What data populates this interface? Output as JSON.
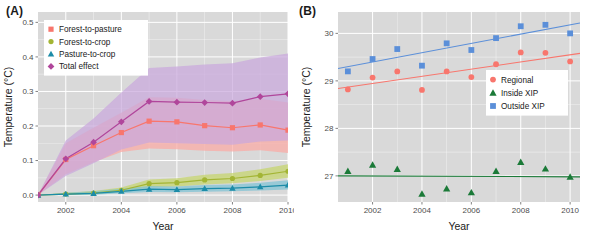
{
  "figure": {
    "panels": [
      {
        "label": "(A)"
      },
      {
        "label": "(B)"
      }
    ]
  },
  "chart_data": [
    {
      "type": "line",
      "panel": "(A)",
      "title": "",
      "xlabel": "Year",
      "ylabel": "Temperature (°C)",
      "xlim": [
        2001,
        2010
      ],
      "ylim": [
        -0.02,
        0.53
      ],
      "xticks": [
        2002,
        2004,
        2006,
        2008,
        2010
      ],
      "yticks": [
        0.0,
        0.1,
        0.2,
        0.3,
        0.4,
        0.5
      ],
      "ytick_labels": [
        "0.0",
        "0.1",
        "0.2",
        "0.3",
        "0.4",
        "0.5"
      ],
      "grid": true,
      "legend_position": "top-left",
      "x": [
        2001,
        2002,
        2003,
        2004,
        2005,
        2006,
        2007,
        2008,
        2009,
        2010
      ],
      "series": [
        {
          "name": "Forest-to-pasture",
          "color": "#F8766D",
          "marker": "square",
          "values": [
            0.0,
            0.103,
            0.143,
            0.181,
            0.214,
            0.212,
            0.201,
            0.195,
            0.203,
            0.188
          ],
          "band_lower": [
            0.0,
            0.06,
            0.095,
            0.125,
            0.135,
            0.133,
            0.128,
            0.126,
            0.13,
            0.122
          ],
          "band_upper": [
            0.0,
            0.15,
            0.195,
            0.238,
            0.283,
            0.282,
            0.275,
            0.272,
            0.279,
            0.268
          ],
          "band_color": "#FBA9A3"
        },
        {
          "name": "Forest-to-crop",
          "color": "#A3B534",
          "marker": "circle",
          "values": [
            0.0,
            0.003,
            0.006,
            0.014,
            0.033,
            0.036,
            0.044,
            0.048,
            0.057,
            0.069
          ],
          "band_lower": [
            0.0,
            0.0,
            0.002,
            0.008,
            0.023,
            0.025,
            0.031,
            0.034,
            0.041,
            0.05
          ],
          "band_upper": [
            0.0,
            0.007,
            0.012,
            0.022,
            0.045,
            0.049,
            0.059,
            0.064,
            0.075,
            0.089
          ],
          "band_color": "#C5D46B"
        },
        {
          "name": "Pasture-to-crop",
          "color": "#1C8CA8",
          "marker": "triangle",
          "values": [
            0.0,
            0.003,
            0.005,
            0.011,
            0.017,
            0.016,
            0.019,
            0.02,
            0.024,
            0.029
          ],
          "band_lower": [
            0.0,
            0.0,
            0.001,
            0.005,
            0.009,
            0.008,
            0.01,
            0.011,
            0.013,
            0.016
          ],
          "band_upper": [
            0.0,
            0.007,
            0.011,
            0.018,
            0.026,
            0.025,
            0.029,
            0.031,
            0.036,
            0.043
          ],
          "band_color": "#7EC2D4"
        },
        {
          "name": "Total effect",
          "color": "#B0469B",
          "marker": "diamond",
          "values": [
            0.0,
            0.105,
            0.153,
            0.212,
            0.271,
            0.269,
            0.268,
            0.266,
            0.285,
            0.293
          ],
          "band_lower": [
            0.0,
            0.055,
            0.092,
            0.132,
            0.152,
            0.15,
            0.148,
            0.146,
            0.155,
            0.158
          ],
          "band_upper": [
            0.0,
            0.158,
            0.222,
            0.297,
            0.368,
            0.372,
            0.378,
            0.382,
            0.398,
            0.41
          ],
          "band_color": "#C9A8DC"
        }
      ]
    },
    {
      "type": "scatter",
      "panel": "(B)",
      "title": "",
      "xlabel": "Year",
      "ylabel": "Temperature (°C)",
      "xlim": [
        2000.6,
        2010.4
      ],
      "ylim": [
        26.45,
        30.45
      ],
      "xticks": [
        2002,
        2004,
        2006,
        2008,
        2010
      ],
      "yticks": [
        27,
        28,
        29,
        30
      ],
      "ytick_labels": [
        "27",
        "28",
        "29",
        "30"
      ],
      "grid": true,
      "legend_position": "right-middle",
      "x": [
        2001,
        2002,
        2003,
        2004,
        2005,
        2006,
        2007,
        2008,
        2009,
        2010
      ],
      "series": [
        {
          "name": "Regional",
          "color": "#F8766D",
          "marker": "circle",
          "values": [
            28.82,
            29.07,
            29.2,
            28.81,
            29.2,
            29.08,
            29.35,
            29.6,
            29.59,
            29.41
          ],
          "trend": [
            28.84,
            29.58
          ]
        },
        {
          "name": "Inside XIP",
          "color": "#1B7A38",
          "marker": "triangle",
          "values": [
            27.1,
            27.23,
            27.14,
            26.62,
            26.73,
            26.65,
            27.1,
            27.29,
            27.15,
            26.98
          ],
          "trend": [
            27.0,
            26.98
          ]
        },
        {
          "name": "Outside XIP",
          "color": "#5B8FD9",
          "marker": "square",
          "values": [
            29.2,
            29.46,
            29.67,
            29.32,
            29.79,
            29.65,
            29.9,
            30.15,
            30.18,
            30.0
          ],
          "trend": [
            29.26,
            30.22
          ]
        }
      ]
    }
  ]
}
